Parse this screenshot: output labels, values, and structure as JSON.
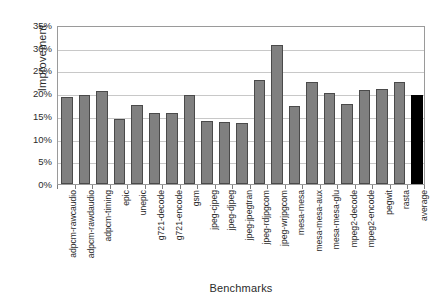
{
  "chart_data": {
    "type": "bar",
    "title": "",
    "xlabel": "Benchmarks",
    "ylabel": "Improvement",
    "ylim": [
      0,
      35
    ],
    "ytick_labels": [
      "35%",
      "30%",
      "25%",
      "20%",
      "15%",
      "10%",
      "5%",
      "0%"
    ],
    "ytick_values": [
      35,
      30,
      25,
      20,
      15,
      10,
      5,
      0
    ],
    "grid": true,
    "legend": "none",
    "bar_color": "#808080",
    "bar_edge_color": "#4a4a4a",
    "highlight_color": "#000000",
    "highlight_category": "average",
    "categories": [
      "adpcm-rawcaudio",
      "adpcm-rawdaudio",
      "adpcm-timing",
      "epic",
      "unepic",
      "g721-decode",
      "g721-encode",
      "gsm",
      "jpeg-cjpeg",
      "jpeg-djpeg",
      "jpeg-jpegtran",
      "jpeg-rdjpgcom",
      "jpeg-wrjpgcom",
      "mesa-mesa",
      "mesa-mesa-aux",
      "mesa-mesa-glu",
      "mpeg2-decode",
      "mpeg2-encode",
      "pegwit",
      "rasta",
      "average"
    ],
    "values": [
      19.2,
      19.7,
      20.4,
      14.3,
      17.5,
      15.7,
      15.7,
      19.6,
      13.8,
      13.6,
      13.5,
      22.8,
      30.5,
      17.2,
      22.4,
      20.0,
      17.7,
      20.7,
      21.0,
      22.5,
      19.5
    ]
  }
}
